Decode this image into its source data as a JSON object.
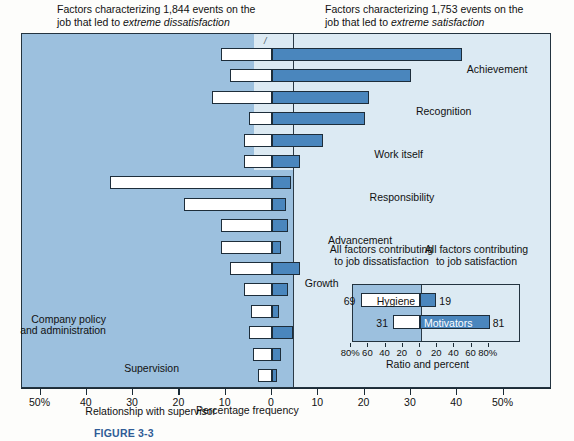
{
  "captions": {
    "left_line1": "Factors characterizing 1,844 events on the",
    "left_line2_pre": "job that led to ",
    "left_line2_em": "extreme dissatisfaction",
    "right_line1": "Factors characterizing 1,753 events on the",
    "right_line2_pre": "job that led to ",
    "right_line2_em": "extreme satisfaction"
  },
  "figure_caption": "FIGURE 3-3",
  "chart_data": {
    "type": "bar",
    "xlabel": "Percentage frequency",
    "ylabel": "",
    "xlim": [
      -55,
      55
    ],
    "grid": false,
    "legend_position": "none",
    "orientation": "horizontal-diverging",
    "axis_ticks_left": [
      "50%",
      "40",
      "30",
      "20",
      "10",
      "0"
    ],
    "axis_ticks_right": [
      "0",
      "10",
      "20",
      "30",
      "40",
      "50%"
    ],
    "series": [
      {
        "name": "Dissatisfaction (left, white)",
        "color": "#ffffff"
      },
      {
        "name": "Satisfaction (right, blue)",
        "color": "#4a86bd"
      }
    ],
    "categories": [
      "Achievement",
      "Recognition",
      "Work itself",
      "Responsibility",
      "Advancement",
      "Growth",
      "Company policy and administration",
      "Supervision",
      "Relationship with supervisor",
      "Work conditions",
      "Salary",
      "Relationship with peers",
      "Personal life",
      "Relationship with subordinates",
      "Status",
      "Security"
    ],
    "dissatisfaction_values": [
      11,
      9,
      13,
      5,
      6,
      6,
      35,
      19,
      11,
      11,
      9,
      6,
      4.5,
      5,
      4,
      3
    ],
    "satisfaction_values": [
      41,
      30,
      21,
      20,
      11,
      6,
      4,
      3,
      3.5,
      2,
      6,
      3.5,
      1.5,
      4.5,
      2,
      1
    ]
  },
  "bars": [
    {
      "label": "Achievement",
      "neg": 11,
      "pos": 41,
      "label_side": "right"
    },
    {
      "label": "Recognition",
      "neg": 9,
      "pos": 30,
      "label_side": "right"
    },
    {
      "label": "Work itself",
      "neg": 13,
      "pos": 21,
      "label_side": "right"
    },
    {
      "label": "Responsibility",
      "neg": 5,
      "pos": 20,
      "label_side": "right"
    },
    {
      "label": "Advancement",
      "neg": 6,
      "pos": 11,
      "label_side": "right"
    },
    {
      "label": "Growth",
      "neg": 6,
      "pos": 6,
      "label_side": "right"
    },
    {
      "label": "Company policy and administration",
      "neg": 35,
      "pos": 4,
      "label_side": "left"
    },
    {
      "label": "Supervision",
      "neg": 19,
      "pos": 3,
      "label_side": "left"
    },
    {
      "label": "Relationship with supervisor",
      "neg": 11,
      "pos": 3.5,
      "label_side": "left"
    },
    {
      "label": "Work conditions",
      "neg": 11,
      "pos": 2,
      "label_side": "left"
    },
    {
      "label": "Salary",
      "neg": 9,
      "pos": 6,
      "label_side": "left"
    },
    {
      "label": "Relationship with peers",
      "neg": 6,
      "pos": 3.5,
      "label_side": "left"
    },
    {
      "label": "Personal life",
      "neg": 4.5,
      "pos": 1.5,
      "label_side": "left"
    },
    {
      "label": "Relationship with subordinates",
      "neg": 5,
      "pos": 4.5,
      "label_side": "left"
    },
    {
      "label": "Status",
      "neg": 4,
      "pos": 2,
      "label_side": "left"
    },
    {
      "label": "Security",
      "neg": 3,
      "pos": 1,
      "label_side": "left"
    }
  ],
  "axis": {
    "title": "Percentage frequency",
    "ticks": [
      {
        "label": "50%",
        "value": -50
      },
      {
        "label": "40",
        "value": -40
      },
      {
        "label": "30",
        "value": -30
      },
      {
        "label": "20",
        "value": -20
      },
      {
        "label": "10",
        "value": -10
      },
      {
        "label": "0",
        "value": 0
      },
      {
        "label": "10",
        "value": 10
      },
      {
        "label": "20",
        "value": 20
      },
      {
        "label": "30",
        "value": 30
      },
      {
        "label": "40",
        "value": 40
      },
      {
        "label": "50%",
        "value": 50
      }
    ]
  },
  "inset": {
    "head_left": "All factors contributing to job dissatisfaction",
    "head_right": "All factors contributing to job satisfaction",
    "axis_title": "Ratio and percent",
    "ticks": [
      {
        "label": "80%",
        "value": -80
      },
      {
        "label": "60",
        "value": -60
      },
      {
        "label": "40",
        "value": -40
      },
      {
        "label": "20",
        "value": -20
      },
      {
        "label": "0",
        "value": 0
      },
      {
        "label": "20",
        "value": 20
      },
      {
        "label": "40",
        "value": 40
      },
      {
        "label": "60",
        "value": 60
      },
      {
        "label": "80%",
        "value": 80
      }
    ],
    "rows": [
      {
        "name": "Hygiene",
        "neg": 69,
        "pos": 19,
        "neg_label": "69",
        "pos_label": "19",
        "name_on": "white"
      },
      {
        "name": "Motivators",
        "neg": 31,
        "pos": 81,
        "neg_label": "31",
        "pos_label": "81",
        "name_on": "blue"
      }
    ]
  },
  "stray_mark": "/"
}
